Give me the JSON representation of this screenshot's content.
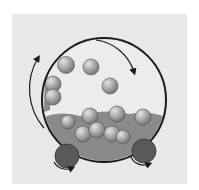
{
  "diagram": {
    "colors": {
      "panel_background": "#e8e8e8",
      "page_background": "#ffffff",
      "drum_outline": "#1a1a1a",
      "ball_light": "#d8d8d8",
      "ball_dark": "#7a7a7a",
      "roller": "#595959",
      "particles": "#6a6a6a",
      "arrow": "#1a1a1a"
    },
    "drum": {
      "cx": 104,
      "cy": 100,
      "r": 62
    },
    "balls": [
      {
        "cx": 66,
        "cy": 65,
        "r": 8.5
      },
      {
        "cx": 91,
        "cy": 67,
        "r": 8
      },
      {
        "cx": 110,
        "cy": 86,
        "r": 8
      },
      {
        "cx": 53,
        "cy": 84,
        "r": 8
      },
      {
        "cx": 53,
        "cy": 97,
        "r": 8
      },
      {
        "cx": 90,
        "cy": 116,
        "r": 8
      },
      {
        "cx": 117,
        "cy": 114,
        "r": 8
      },
      {
        "cx": 143,
        "cy": 117,
        "r": 8
      },
      {
        "cx": 68,
        "cy": 122,
        "r": 7
      },
      {
        "cx": 83,
        "cy": 134,
        "r": 8
      },
      {
        "cx": 97,
        "cy": 130,
        "r": 8
      },
      {
        "cx": 112,
        "cy": 134,
        "r": 8
      },
      {
        "cx": 123,
        "cy": 137,
        "r": 7
      }
    ],
    "rollers": [
      {
        "cx": 67,
        "cy": 156,
        "r": 12
      },
      {
        "cx": 144,
        "cy": 151,
        "r": 12
      }
    ],
    "arrows": [
      {
        "name": "drum-rotation-arrow",
        "d": "M 96 40 A 46 46 0 0 1 134 72"
      },
      {
        "name": "cascade-arrow",
        "d": "M 44 128 A 60 60 0 0 1 38 58"
      },
      {
        "name": "left-roller-arrow",
        "d": "M 54 162 A 14 14 0 0 0 72 168"
      },
      {
        "name": "right-roller-arrow",
        "d": "M 131 157 A 14 14 0 0 0 149 164"
      }
    ]
  }
}
